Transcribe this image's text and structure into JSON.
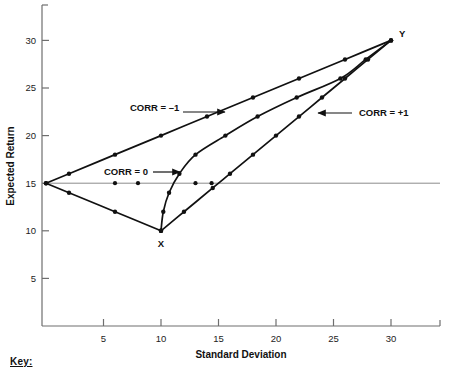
{
  "key_section": {
    "label": "Key:"
  },
  "chart_data": {
    "type": "line",
    "title": "",
    "subtitle": "",
    "xlabel": "Standard Deviation",
    "ylabel": "Expected Return",
    "xlim": [
      0,
      34
    ],
    "ylim": [
      0,
      34
    ],
    "xticks": [
      5,
      10,
      15,
      20,
      25,
      30
    ],
    "yticks": [
      5,
      10,
      15,
      20,
      25,
      30
    ],
    "xtick_labels": [
      "5",
      "10",
      "15",
      "20",
      "25",
      "30"
    ],
    "ytick_labels": [
      "5",
      "10",
      "15",
      "20",
      "25",
      "30"
    ],
    "grid": false,
    "legend_position": "inline-annotations",
    "reference_lines": [
      {
        "name": "expected-return-15-reference",
        "orientation": "horizontal",
        "value": 15,
        "color": "#8c8c8c"
      }
    ],
    "endpoints": [
      {
        "name": "X",
        "label": "X",
        "x": 10,
        "y": 10
      },
      {
        "name": "Y",
        "label": "Y",
        "x": 30,
        "y": 30
      }
    ],
    "series": [
      {
        "name": "CORR = -1",
        "label": "CORR = –1",
        "color": "#111111",
        "points": [
          {
            "x": 0.0,
            "y": 15.0
          },
          {
            "x": 2.0,
            "y": 16.0
          },
          {
            "x": 6.0,
            "y": 18.0
          },
          {
            "x": 10.0,
            "y": 20.0
          },
          {
            "x": 14.0,
            "y": 22.0
          },
          {
            "x": 18.0,
            "y": 24.0
          },
          {
            "x": 22.0,
            "y": 26.0
          },
          {
            "x": 26.0,
            "y": 28.0
          },
          {
            "x": 30.0,
            "y": 30.0
          }
        ],
        "lower_branch_points": [
          {
            "x": 0.0,
            "y": 15.0
          },
          {
            "x": 2.0,
            "y": 14.0
          },
          {
            "x": 6.0,
            "y": 12.0
          },
          {
            "x": 10.0,
            "y": 10.0
          }
        ]
      },
      {
        "name": "CORR = 0",
        "label": "CORR = 0",
        "color": "#111111",
        "points": [
          {
            "x": 10.0,
            "y": 10.0
          },
          {
            "x": 10.2,
            "y": 12.0
          },
          {
            "x": 10.7,
            "y": 14.0
          },
          {
            "x": 11.6,
            "y": 16.0
          },
          {
            "x": 13.0,
            "y": 18.0
          },
          {
            "x": 15.6,
            "y": 20.0
          },
          {
            "x": 18.4,
            "y": 22.0
          },
          {
            "x": 21.8,
            "y": 24.0
          },
          {
            "x": 25.6,
            "y": 26.0
          },
          {
            "x": 27.8,
            "y": 28.0
          },
          {
            "x": 30.0,
            "y": 30.0
          }
        ]
      },
      {
        "name": "CORR = +1",
        "label": "CORR = +1",
        "color": "#111111",
        "points": [
          {
            "x": 10.0,
            "y": 10.0
          },
          {
            "x": 12.0,
            "y": 12.0
          },
          {
            "x": 14.5,
            "y": 14.5
          },
          {
            "x": 16.0,
            "y": 16.0
          },
          {
            "x": 18.0,
            "y": 18.0
          },
          {
            "x": 20.0,
            "y": 20.0
          },
          {
            "x": 22.0,
            "y": 22.0
          },
          {
            "x": 24.0,
            "y": 24.0
          },
          {
            "x": 26.0,
            "y": 26.0
          },
          {
            "x": 28.0,
            "y": 28.0
          },
          {
            "x": 30.0,
            "y": 30.0
          }
        ]
      }
    ],
    "reference_line_markers": [
      {
        "x": 6.0,
        "y": 15.0
      },
      {
        "x": 8.0,
        "y": 15.0
      },
      {
        "x": 13.0,
        "y": 15.0
      },
      {
        "x": 14.4,
        "y": 15.0
      }
    ],
    "annotations": [
      {
        "name": "corr-minus-1",
        "text": "CORR = –1",
        "text_x": 130,
        "text_y": 111,
        "arrow_from_x": 183,
        "arrow_from_y": 112,
        "arrow_to_x": 225,
        "arrow_to_y": 112,
        "anchor": "start"
      },
      {
        "name": "corr-zero",
        "text": "CORR = 0",
        "text_x": 104,
        "text_y": 175,
        "arrow_from_x": 153,
        "arrow_from_y": 172,
        "arrow_to_x": 180,
        "arrow_to_y": 172,
        "anchor": "start"
      },
      {
        "name": "corr-plus-1",
        "text": "CORR = +1",
        "text_x": 359,
        "text_y": 116,
        "arrow_from_x": 352,
        "arrow_from_y": 113,
        "arrow_to_x": 318,
        "arrow_to_y": 113,
        "anchor": "start"
      }
    ]
  }
}
